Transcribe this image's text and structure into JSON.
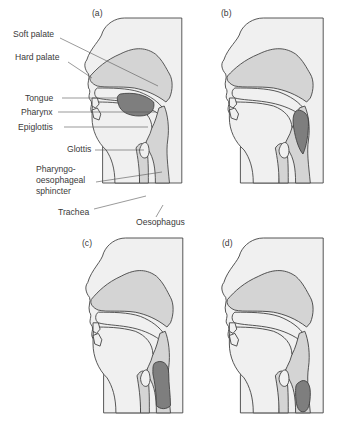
{
  "figure": {
    "colors": {
      "background": "#ffffff",
      "panel_fill": "#f0f0f0",
      "tissue_fill": "#d4d4d4",
      "bolus_fill": "#7e7e7e",
      "outline": "#3f3f3f",
      "text": "#3a3a3a"
    },
    "panels": [
      {
        "id": "a",
        "label": "(a)"
      },
      {
        "id": "b",
        "label": "(b)"
      },
      {
        "id": "c",
        "label": "(c)"
      },
      {
        "id": "d",
        "label": "(d)"
      }
    ],
    "labels": [
      {
        "key": "soft_palate",
        "text": "Soft palate"
      },
      {
        "key": "hard_palate",
        "text": "Hard palate"
      },
      {
        "key": "tongue",
        "text": "Tongue"
      },
      {
        "key": "pharynx",
        "text": "Pharynx"
      },
      {
        "key": "epiglottis",
        "text": "Epiglottis"
      },
      {
        "key": "glottis",
        "text": "Glottis"
      },
      {
        "key": "pos_1",
        "text": "Pharyngo-"
      },
      {
        "key": "pos_2",
        "text": "oesophageal"
      },
      {
        "key": "pos_3",
        "text": "sphincter"
      },
      {
        "key": "trachea",
        "text": "Trachea"
      },
      {
        "key": "oesophagus",
        "text": "Oesophagus"
      }
    ]
  }
}
